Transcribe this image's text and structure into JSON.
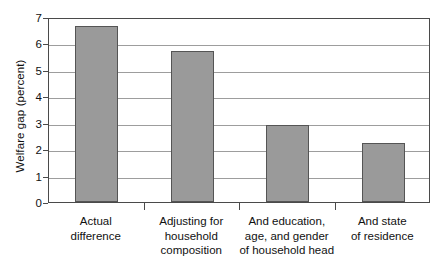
{
  "chart_data": {
    "type": "bar",
    "title": "",
    "subtitle": "",
    "xlabel": "",
    "ylabel": "Welfare gap (percent)",
    "categories": [
      "Actual\ndifference",
      "Adjusting for\nhousehold\ncomposition",
      "And education,\nage, and gender\nof household head",
      "And state\nof residence"
    ],
    "values": [
      6.65,
      5.72,
      2.93,
      2.23
    ],
    "ylim": [
      0,
      7
    ],
    "yticks": [
      0,
      1,
      2,
      3,
      4,
      5,
      6,
      7
    ],
    "ytick_labels": [
      "0",
      "1",
      "2",
      "3",
      "4",
      "5",
      "6",
      "7"
    ],
    "grid": true,
    "legend": false,
    "legend_position": "none",
    "bar_color": "#9a9a9a",
    "bar_edge_color": "#555555",
    "axis_color": "#4a4a4a",
    "grid_color": "#9d9d9d",
    "background_color": "#ffffff"
  }
}
